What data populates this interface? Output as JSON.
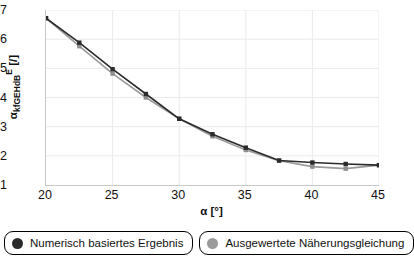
{
  "chart_data": {
    "type": "line",
    "title": "",
    "xlabel": "α [°]",
    "ylabel": "α_kfGEHdB^E [/]",
    "ylabel_parts": {
      "base": "α",
      "sub": "kfGEHdB",
      "sup": "E",
      "unit": "[/]"
    },
    "xlim": [
      20,
      45
    ],
    "ylim": [
      3.1,
      3.7
    ],
    "grid": true,
    "legend_position": "bottom",
    "x": [
      20,
      22.5,
      25,
      27.5,
      30,
      32.5,
      35,
      37.5,
      40,
      42.5,
      45
    ],
    "xticks": [
      "20",
      "25",
      "30",
      "35",
      "40",
      "45"
    ],
    "xtick_values": [
      20,
      25,
      30,
      35,
      40,
      45
    ],
    "yticks": [
      "3,1",
      "3,2",
      "3,3",
      "3,4",
      "3,5",
      "3,6",
      "3,7"
    ],
    "ytick_values": [
      3.1,
      3.2,
      3.3,
      3.4,
      3.5,
      3.6,
      3.7
    ],
    "series": [
      {
        "name": "Numerisch basiertes Ergebnis",
        "color": "#2b2b2b",
        "marker_color": "#2b2b2b",
        "values": [
          3.672,
          3.588,
          3.497,
          3.412,
          3.327,
          3.274,
          3.228,
          3.184,
          3.177,
          3.172,
          3.168
        ]
      },
      {
        "name": "Ausgewertete Näherungsgleichung",
        "color": "#9a9a9a",
        "marker_color": "#8e8e8e",
        "values": [
          3.672,
          3.576,
          3.482,
          3.4,
          3.327,
          3.267,
          3.22,
          3.183,
          3.163,
          3.156,
          3.168
        ]
      }
    ]
  },
  "legend": {
    "items": [
      {
        "label": "Numerisch basiertes Ergebnis",
        "color": "#2b2b2b"
      },
      {
        "label": "Ausgewertete Näherungsgleichung",
        "color": "#9a9a9a"
      }
    ]
  }
}
